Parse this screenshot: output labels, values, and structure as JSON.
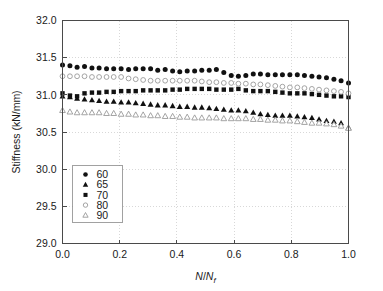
{
  "chart_data": {
    "type": "scatter",
    "title": "",
    "xlabel": "N/Nf",
    "xlabel_parts": {
      "numerator": "N",
      "slash": "/",
      "denominator": "N",
      "subscript": "f"
    },
    "ylabel": "Stiffness (kN/mm)",
    "xlim": [
      0.0,
      1.0
    ],
    "ylim": [
      29.0,
      32.0
    ],
    "xticks": [
      0.0,
      0.2,
      0.4,
      0.6,
      0.8,
      1.0
    ],
    "xtick_labels": [
      "0.0",
      "0.2",
      "0.4",
      "0.6",
      "0.8",
      "1.0"
    ],
    "yticks": [
      29.0,
      29.5,
      30.0,
      30.5,
      31.0,
      31.5,
      32.0
    ],
    "ytick_labels": [
      "29.0",
      "29.5",
      "30.0",
      "30.5",
      "31.0",
      "31.5",
      "32.0"
    ],
    "grid": true,
    "grid_style": "dotted",
    "legend_position": "lower-left",
    "legend_title": "",
    "series": [
      {
        "name": "60",
        "marker": "filled-circle",
        "color": "#111111",
        "x": [
          0.0,
          0.026,
          0.051,
          0.077,
          0.103,
          0.128,
          0.154,
          0.179,
          0.205,
          0.231,
          0.256,
          0.282,
          0.308,
          0.333,
          0.359,
          0.385,
          0.41,
          0.436,
          0.462,
          0.487,
          0.513,
          0.538,
          0.564,
          0.59,
          0.615,
          0.641,
          0.667,
          0.692,
          0.718,
          0.744,
          0.769,
          0.795,
          0.821,
          0.846,
          0.872,
          0.897,
          0.923,
          0.949,
          0.974,
          1.0
        ],
        "values": [
          31.4,
          31.39,
          31.37,
          31.38,
          31.36,
          31.36,
          31.35,
          31.35,
          31.35,
          31.34,
          31.35,
          31.35,
          31.35,
          31.33,
          31.34,
          31.32,
          31.31,
          31.32,
          31.32,
          31.33,
          31.33,
          31.34,
          31.3,
          31.26,
          31.25,
          31.26,
          31.28,
          31.28,
          31.27,
          31.27,
          31.27,
          31.27,
          31.27,
          31.26,
          31.25,
          31.24,
          31.23,
          31.21,
          31.19,
          31.16
        ]
      },
      {
        "name": "65",
        "marker": "filled-triangle",
        "color": "#111111",
        "x": [
          0.0,
          0.026,
          0.051,
          0.077,
          0.103,
          0.128,
          0.154,
          0.179,
          0.205,
          0.231,
          0.256,
          0.282,
          0.308,
          0.333,
          0.359,
          0.385,
          0.41,
          0.436,
          0.462,
          0.487,
          0.513,
          0.538,
          0.564,
          0.59,
          0.615,
          0.641,
          0.667,
          0.692,
          0.718,
          0.744,
          0.769,
          0.795,
          0.821,
          0.846,
          0.872,
          0.897,
          0.923,
          0.949,
          0.974,
          1.0
        ],
        "values": [
          30.98,
          30.97,
          30.95,
          30.94,
          30.93,
          30.92,
          30.91,
          30.91,
          30.9,
          30.9,
          30.89,
          30.88,
          30.87,
          30.86,
          30.86,
          30.85,
          30.84,
          30.84,
          30.83,
          30.83,
          30.82,
          30.81,
          30.8,
          30.79,
          30.79,
          30.78,
          30.76,
          30.74,
          30.73,
          30.72,
          30.72,
          30.72,
          30.71,
          30.7,
          30.69,
          30.67,
          30.65,
          30.64,
          30.62,
          30.56
        ]
      },
      {
        "name": "70",
        "marker": "filled-square",
        "color": "#111111",
        "x": [
          0.0,
          0.026,
          0.051,
          0.077,
          0.103,
          0.128,
          0.154,
          0.179,
          0.205,
          0.231,
          0.256,
          0.282,
          0.308,
          0.333,
          0.359,
          0.385,
          0.41,
          0.436,
          0.462,
          0.487,
          0.513,
          0.538,
          0.564,
          0.59,
          0.615,
          0.641,
          0.667,
          0.692,
          0.718,
          0.744,
          0.769,
          0.795,
          0.821,
          0.846,
          0.872,
          0.897,
          0.923,
          0.949,
          0.974,
          1.0
        ],
        "values": [
          31.02,
          30.99,
          30.98,
          31.02,
          31.03,
          31.03,
          31.04,
          31.04,
          31.05,
          31.05,
          31.05,
          31.06,
          31.06,
          31.06,
          31.06,
          31.07,
          31.07,
          31.08,
          31.08,
          31.08,
          31.08,
          31.07,
          31.07,
          31.07,
          31.08,
          31.06,
          31.05,
          31.05,
          31.05,
          31.04,
          31.03,
          31.02,
          31.02,
          31.02,
          31.01,
          31.0,
          30.99,
          30.98,
          30.98,
          30.97
        ]
      },
      {
        "name": "80",
        "marker": "open-circle",
        "color": "#9a9a9a",
        "x": [
          0.0,
          0.026,
          0.051,
          0.077,
          0.103,
          0.128,
          0.154,
          0.179,
          0.205,
          0.231,
          0.256,
          0.282,
          0.308,
          0.333,
          0.359,
          0.385,
          0.41,
          0.436,
          0.462,
          0.487,
          0.513,
          0.538,
          0.564,
          0.59,
          0.615,
          0.641,
          0.667,
          0.692,
          0.718,
          0.744,
          0.769,
          0.795,
          0.821,
          0.846,
          0.872,
          0.897,
          0.923,
          0.949,
          0.974,
          1.0
        ],
        "values": [
          31.25,
          31.25,
          31.25,
          31.25,
          31.24,
          31.24,
          31.24,
          31.24,
          31.24,
          31.22,
          31.21,
          31.2,
          31.19,
          31.19,
          31.19,
          31.19,
          31.19,
          31.19,
          31.19,
          31.18,
          31.17,
          31.17,
          31.16,
          31.16,
          31.15,
          31.15,
          31.14,
          31.14,
          31.13,
          31.12,
          31.11,
          31.1,
          31.1,
          31.09,
          31.08,
          31.07,
          31.06,
          31.05,
          31.04,
          31.02
        ]
      },
      {
        "name": "90",
        "marker": "open-triangle",
        "color": "#9a9a9a",
        "x": [
          0.0,
          0.026,
          0.051,
          0.077,
          0.103,
          0.128,
          0.154,
          0.179,
          0.205,
          0.231,
          0.256,
          0.282,
          0.308,
          0.333,
          0.359,
          0.385,
          0.41,
          0.436,
          0.462,
          0.487,
          0.513,
          0.538,
          0.564,
          0.59,
          0.615,
          0.641,
          0.667,
          0.692,
          0.718,
          0.744,
          0.769,
          0.795,
          0.821,
          0.846,
          0.872,
          0.897,
          0.923,
          0.949,
          0.974,
          1.0
        ],
        "values": [
          30.79,
          30.77,
          30.76,
          30.76,
          30.76,
          30.76,
          30.75,
          30.75,
          30.74,
          30.74,
          30.73,
          30.73,
          30.72,
          30.72,
          30.71,
          30.71,
          30.7,
          30.7,
          30.69,
          30.69,
          30.69,
          30.69,
          30.68,
          30.68,
          30.68,
          30.68,
          30.67,
          30.67,
          30.66,
          30.66,
          30.65,
          30.65,
          30.64,
          30.63,
          30.62,
          30.62,
          30.61,
          30.6,
          30.58,
          30.55
        ]
      }
    ]
  }
}
